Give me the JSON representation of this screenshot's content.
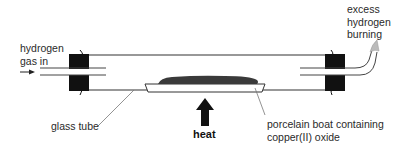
{
  "diagram": {
    "labels": {
      "hydrogen_in_line1": "hydrogen",
      "hydrogen_in_line2": "gas in",
      "excess_line1": "excess",
      "excess_line2": "hydrogen",
      "excess_line3": "burning",
      "glass_tube": "glass tube",
      "heat": "heat",
      "boat_line1": "porcelain boat containing",
      "boat_line2": "copper(II) oxide"
    },
    "components": [
      "inlet tube",
      "left stopper",
      "glass tube",
      "porcelain boat",
      "copper(II) oxide",
      "heat arrow",
      "right stopper",
      "outlet tube",
      "flame"
    ],
    "colors": {
      "line": "#333333",
      "stopper": "#111111",
      "oxide": "#3a3a3a",
      "leader": "#666666",
      "flame": "#bbbbbb"
    }
  }
}
